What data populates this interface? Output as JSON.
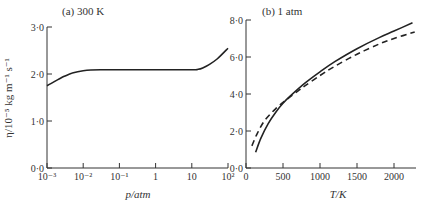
{
  "chart_data": [
    {
      "type": "line",
      "panel": "a",
      "title": "(a) 300 K",
      "xlabel": "p/atm",
      "ylabel": "η/10⁻⁵ kg m⁻¹ s⁻¹",
      "x_scale": "log",
      "xlim": [
        0.001,
        100
      ],
      "ylim": [
        0.0,
        3.0
      ],
      "x_tick_labels": [
        "10⁻³",
        "10⁻²",
        "10⁻¹",
        "1",
        "10",
        "10²"
      ],
      "y_tick_labels": [
        "0·0",
        "1·0",
        "2·0",
        "3·0"
      ],
      "grid": false,
      "series": [
        {
          "name": "viscosity vs pressure",
          "style": "solid",
          "x": [
            0.001,
            0.002,
            0.003,
            0.005,
            0.01,
            0.03,
            0.1,
            1,
            10,
            15,
            20,
            30,
            50,
            100
          ],
          "y": [
            1.75,
            1.88,
            1.95,
            2.02,
            2.07,
            2.09,
            2.09,
            2.09,
            2.09,
            2.1,
            2.13,
            2.2,
            2.32,
            2.55
          ]
        }
      ]
    },
    {
      "type": "line",
      "panel": "b",
      "title": "(b) 1 atm",
      "xlabel": "T/K",
      "ylabel": "",
      "xlim": [
        0,
        2300
      ],
      "ylim": [
        0.0,
        8.0
      ],
      "x_tick_labels": [
        "0",
        "500",
        "1000",
        "1500",
        "2000"
      ],
      "y_tick_labels": [
        "0·0",
        "2·0",
        "4·0",
        "6·0",
        "8·0"
      ],
      "grid": false,
      "series": [
        {
          "name": "solid curve",
          "style": "solid",
          "x": [
            130,
            200,
            300,
            400,
            500,
            600,
            800,
            1000,
            1200,
            1500,
            1800,
            2000,
            2250
          ],
          "y": [
            0.85,
            1.6,
            2.4,
            3.0,
            3.5,
            3.9,
            4.6,
            5.2,
            5.75,
            6.45,
            7.05,
            7.4,
            7.85
          ]
        },
        {
          "name": "dashed curve",
          "style": "dashed",
          "x": [
            80,
            150,
            250,
            400,
            550,
            700,
            800,
            1000,
            1200,
            1500,
            1800,
            2000,
            2280
          ],
          "y": [
            1.2,
            1.85,
            2.55,
            3.2,
            3.7,
            4.15,
            4.45,
            5.0,
            5.5,
            6.15,
            6.7,
            7.0,
            7.35
          ]
        }
      ]
    }
  ]
}
